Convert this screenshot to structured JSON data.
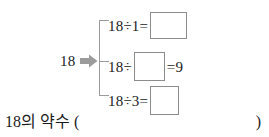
{
  "page": {
    "background_color": "#ffffff",
    "text_color": "#1c1c1c",
    "accent_gray": "#9b9b9b",
    "box_border_color": "#8c8c8c"
  },
  "diagram": {
    "source_number": "18",
    "arrow_icon": "right-block-arrow-icon",
    "arrow_color": "#9b9b9b",
    "bracket_color": "#9b9b9b",
    "rows": [
      {
        "id": "row-1",
        "prefix": "18÷1=",
        "box_value": "",
        "suffix": "",
        "divisor": "1",
        "quotient": ""
      },
      {
        "id": "row-2",
        "prefix": "18÷",
        "box_value": "",
        "suffix": "=9",
        "divisor": "",
        "quotient": "9"
      },
      {
        "id": "row-3",
        "prefix": "18÷3=",
        "box_value": "",
        "suffix": "",
        "divisor": "3",
        "quotient": ""
      }
    ]
  },
  "prompt": {
    "label": "18의 약수 (",
    "close": ")"
  }
}
